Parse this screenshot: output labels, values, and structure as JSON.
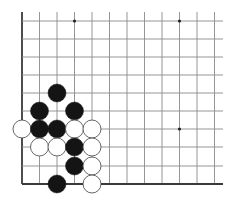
{
  "diagram": {
    "type": "go-board-corner",
    "corner": "bottom-left",
    "colors": {
      "background": "#ffffff",
      "grid_line": "#8a8a8a",
      "edge_line": "#3a3a3a",
      "black_stone": "#141414",
      "white_stone_fill": "#ffffff",
      "white_stone_stroke": "#555555",
      "star_point": "#222222"
    },
    "grid": {
      "x_lines": [
        22,
        39.5,
        57,
        74.5,
        92,
        109.5,
        127,
        144.5,
        162,
        179.5,
        197,
        214.5
      ],
      "y_lines": [
        21,
        39,
        57,
        75,
        93,
        111,
        129,
        147,
        166,
        184
      ],
      "top_extent": 12,
      "right_extent": 223,
      "stone_radius": 9
    },
    "star_points": [
      {
        "col": 3,
        "row": 0
      },
      {
        "col": 9,
        "row": 0
      },
      {
        "col": 9,
        "row": 6
      }
    ],
    "stones": [
      {
        "color": "black",
        "col": 2,
        "row": 4
      },
      {
        "color": "black",
        "col": 1,
        "row": 5
      },
      {
        "color": "black",
        "col": 3,
        "row": 5
      },
      {
        "color": "white",
        "col": 0,
        "row": 6
      },
      {
        "color": "black",
        "col": 1,
        "row": 6
      },
      {
        "color": "black",
        "col": 2,
        "row": 6
      },
      {
        "color": "white",
        "col": 3,
        "row": 6
      },
      {
        "color": "white",
        "col": 4,
        "row": 6
      },
      {
        "color": "white",
        "col": 1,
        "row": 7
      },
      {
        "color": "white",
        "col": 2,
        "row": 7
      },
      {
        "color": "black",
        "col": 3,
        "row": 7
      },
      {
        "color": "white",
        "col": 4,
        "row": 7
      },
      {
        "color": "black",
        "col": 3,
        "row": 8
      },
      {
        "color": "white",
        "col": 4,
        "row": 8
      },
      {
        "color": "black",
        "col": 2,
        "row": 9
      },
      {
        "color": "white",
        "col": 4,
        "row": 9
      }
    ]
  }
}
